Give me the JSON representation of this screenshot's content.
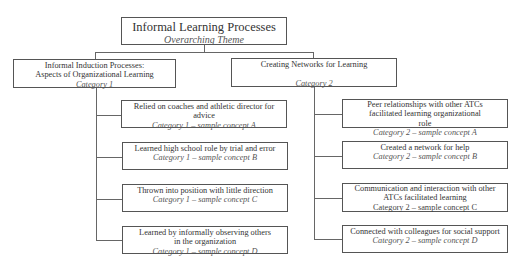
{
  "theme": {
    "title": "Informal Learning Processes",
    "subtitle": "Overarching Theme"
  },
  "categories": [
    {
      "title_line1": "Informal Induction Processes:",
      "title_line2": "Aspects of Organizational Learning",
      "label": "Category 1",
      "concepts": [
        {
          "text": "Relied on coaches and athletic director for advice",
          "label": "Category 1 – sample concept A"
        },
        {
          "text": "Learned high school role by trial and error",
          "label": "Category 1 – sample concept B"
        },
        {
          "text": "Thrown into position with little direction",
          "label": "Category 1 – sample concept C"
        },
        {
          "text": "Learned by informally observing others in the organization",
          "label": "Category 1 – sample concept D"
        }
      ]
    },
    {
      "title_line1": "Creating Networks for Learning",
      "title_line2": "",
      "label": "Category 2",
      "concepts": [
        {
          "text": "Peer relationships with other ATCs facilitated learning organizational role",
          "label": "Category 2 – sample concept A"
        },
        {
          "text": "Created a network for help",
          "label": "Category 2 – sample concept B"
        },
        {
          "text": "Communication and interaction with other ATCs facilitated learning",
          "label": "Category 2 – sample concept C"
        },
        {
          "text": "Connected with colleagues for social support",
          "label": "Category 2 – sample concept D"
        }
      ]
    }
  ]
}
